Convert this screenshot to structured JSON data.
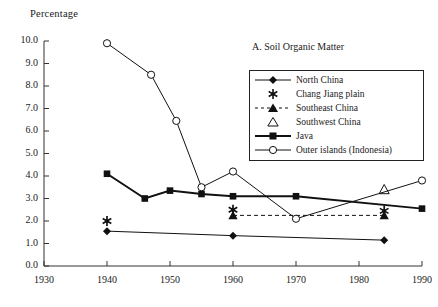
{
  "axis": {
    "ylabel": "Percentage",
    "y_ticks": [
      "10.0",
      "9.0",
      "8.0",
      "7.0",
      "6.0",
      "5.0",
      "4.0",
      "3.0",
      "2.0",
      "1.0",
      "0.0"
    ],
    "x_ticks": [
      "1930",
      "1940",
      "1950",
      "1960",
      "1970",
      "1980",
      "1990"
    ]
  },
  "panel": {
    "title": "A. Soil Organic Matter"
  },
  "legend": {
    "items": [
      {
        "label": "North China",
        "marker": "filled-diamond-line-icon"
      },
      {
        "label": "Chang Jiang plain",
        "marker": "asterisk-icon"
      },
      {
        "label": "Southeast China",
        "marker": "filled-triangle-dashed-icon"
      },
      {
        "label": "Southwest China",
        "marker": "open-triangle-icon"
      },
      {
        "label": "Java",
        "marker": "filled-square-thick-line-icon"
      },
      {
        "label": "Outer islands (Indonesia)",
        "marker": "open-circle-line-icon"
      }
    ]
  },
  "chart_data": {
    "type": "line",
    "title": "A. Soil Organic Matter",
    "xlabel": "",
    "ylabel": "Percentage",
    "xlim": [
      1930,
      1990
    ],
    "ylim": [
      0.0,
      10.0
    ],
    "grid": false,
    "legend_position": "upper-right-inside",
    "series": [
      {
        "name": "North China",
        "marker": "filled-diamond",
        "line": "solid-thin",
        "points": [
          {
            "x": 1940,
            "y": 1.55
          },
          {
            "x": 1960,
            "y": 1.35
          },
          {
            "x": 1984,
            "y": 1.15
          }
        ]
      },
      {
        "name": "Chang Jiang plain",
        "marker": "asterisk",
        "line": "none",
        "points": [
          {
            "x": 1940,
            "y": 2.0
          },
          {
            "x": 1960,
            "y": 2.5
          },
          {
            "x": 1984,
            "y": 2.45
          }
        ]
      },
      {
        "name": "Southeast China",
        "marker": "filled-triangle",
        "line": "dashed",
        "points": [
          {
            "x": 1960,
            "y": 2.25
          },
          {
            "x": 1984,
            "y": 2.25
          }
        ]
      },
      {
        "name": "Southwest China",
        "marker": "open-triangle",
        "line": "none",
        "points": [
          {
            "x": 1984,
            "y": 3.4
          }
        ]
      },
      {
        "name": "Java",
        "marker": "filled-square",
        "line": "solid-thick",
        "points": [
          {
            "x": 1940,
            "y": 4.1
          },
          {
            "x": 1946,
            "y": 3.0
          },
          {
            "x": 1950,
            "y": 3.35
          },
          {
            "x": 1955,
            "y": 3.2
          },
          {
            "x": 1960,
            "y": 3.1
          },
          {
            "x": 1970,
            "y": 3.1
          },
          {
            "x": 1990,
            "y": 2.55
          }
        ]
      },
      {
        "name": "Outer islands (Indonesia)",
        "marker": "open-circle",
        "line": "solid-thin",
        "points": [
          {
            "x": 1940,
            "y": 9.9
          },
          {
            "x": 1947,
            "y": 8.5
          },
          {
            "x": 1951,
            "y": 6.45
          },
          {
            "x": 1955,
            "y": 3.5
          },
          {
            "x": 1960,
            "y": 4.2
          },
          {
            "x": 1970,
            "y": 2.1
          },
          {
            "x": 1990,
            "y": 3.8
          }
        ]
      }
    ]
  }
}
